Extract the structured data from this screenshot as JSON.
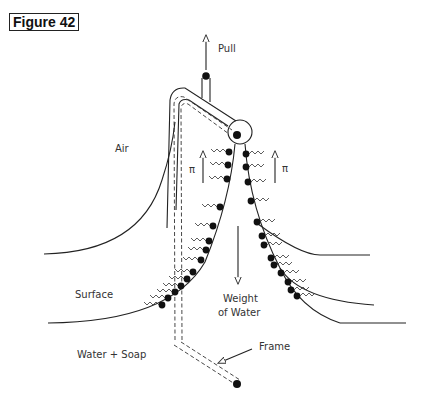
{
  "figure": {
    "label": "Figure 42"
  },
  "labels": {
    "pull": "Pull",
    "air": "Air",
    "pi_left": "π",
    "pi_right": "π",
    "surface": "Surface",
    "weight_line1": "Weight",
    "weight_line2": "of Water",
    "water_soap": "Water + Soap",
    "frame": "Frame"
  },
  "icons": {
    "pull_arrow": "arrow-up-icon",
    "pi_arrows": "arrow-up-icon",
    "weight_arrow": "arrow-down-icon",
    "frame_pointer": "arrow-pointer-icon",
    "soap_molecule": "surfactant-molecule-icon"
  }
}
